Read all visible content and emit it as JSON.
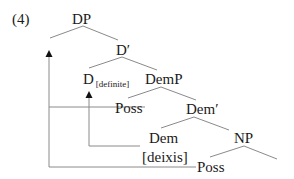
{
  "example_number": "(4)",
  "nodes": {
    "dp": "DP",
    "d_bar": "D′",
    "d": "D",
    "d_feature": "[definite]",
    "demp": "DemP",
    "poss_spec": "Poss",
    "dem_bar": "Dem′",
    "dem": "Dem",
    "dem_feature": "[deixis]",
    "np": "NP",
    "poss_base": "Poss"
  },
  "colors": {
    "line": "#8a8a8a",
    "text": "#1a1a1a",
    "arrow": "#111111"
  }
}
